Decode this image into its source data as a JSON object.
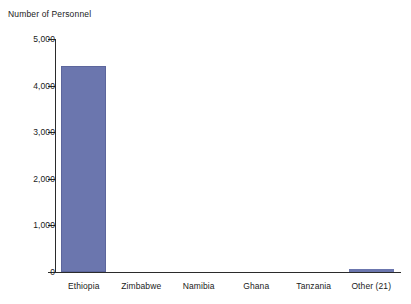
{
  "chart_data": {
    "type": "bar",
    "title": "",
    "ylabel": "Number of Personnel",
    "xlabel": "",
    "categories": [
      "Ethiopia",
      "Zimbabwe",
      "Namibia",
      "Ghana",
      "Tanzania",
      "Other (21)"
    ],
    "values": [
      4420,
      0,
      0,
      0,
      0,
      60
    ],
    "ylim": [
      0,
      5000
    ],
    "ytick_values": [
      5000,
      4000,
      3000,
      2000,
      1000,
      0
    ],
    "ytick_labels": [
      "5,000",
      "4,000",
      "3,000",
      "2,000",
      "1,000",
      "0"
    ],
    "grid": false,
    "legend": false,
    "legend_position": "none",
    "series": [
      {
        "name": "Number of Personnel",
        "values": [
          4420,
          0,
          0,
          0,
          0,
          60
        ],
        "color": "#6B76AE"
      }
    ]
  },
  "colors": {
    "bar": "#6B76AE",
    "bar_edge": "#5C669C",
    "axis": "#2B2B2B",
    "text": "#1A1A1A",
    "background": "#FFFFFF"
  }
}
